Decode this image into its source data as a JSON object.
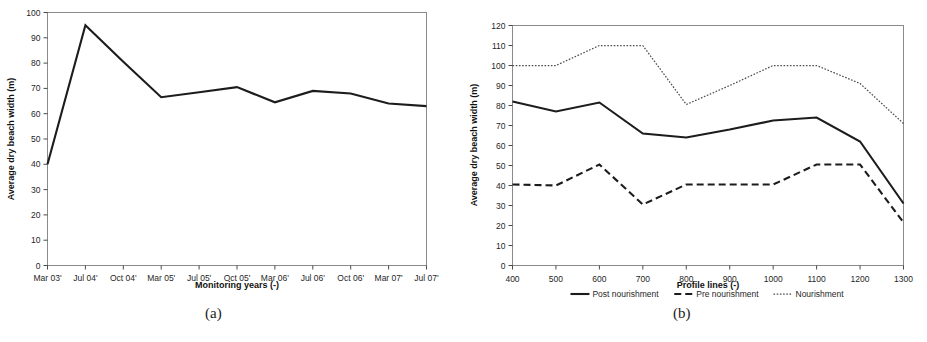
{
  "figure": {
    "caption": "",
    "subcaptions": {
      "a": "(a)",
      "b": "(b)"
    }
  },
  "chart_data": [
    {
      "id": "panel-a",
      "type": "line",
      "title": "",
      "xlabel": "Monitoring years (-)",
      "ylabel": "Average dry beach width (m)",
      "categories": [
        "Mar 03'",
        "Jul 04'",
        "Oct 04'",
        "Mar 05'",
        "Jul 05'",
        "Oct 05'",
        "Mar 06'",
        "Jul 06'",
        "Oct 06'",
        "Mar 07'",
        "Jul 07'"
      ],
      "values": [
        40,
        95,
        80.5,
        66.5,
        68.5,
        70.5,
        64.5,
        69,
        68,
        64,
        63
      ],
      "ylim": [
        0,
        100
      ],
      "yticks": [
        0,
        10,
        20,
        30,
        40,
        50,
        60,
        70,
        80,
        90,
        100
      ],
      "grid": false,
      "legend": null,
      "series_style": "solid"
    },
    {
      "id": "panel-b",
      "type": "line",
      "title": "",
      "xlabel": "Profile lines (-)",
      "ylabel": "Average dry beach width (m)",
      "x": [
        400,
        500,
        600,
        700,
        800,
        900,
        1000,
        1100,
        1200,
        1300
      ],
      "xticks": [
        400,
        500,
        600,
        700,
        800,
        900,
        1000,
        1100,
        1200,
        1300
      ],
      "ylim": [
        0,
        120
      ],
      "yticks": [
        0,
        10,
        20,
        30,
        40,
        50,
        60,
        70,
        80,
        90,
        100,
        110,
        120
      ],
      "grid": false,
      "legend_position": "bottom",
      "series": [
        {
          "name": "Post nourishment",
          "style": "solid",
          "values": [
            82,
            77,
            81.5,
            66,
            64,
            68,
            72.5,
            74,
            62,
            31
          ]
        },
        {
          "name": "Pre nourishment",
          "style": "dashed",
          "values": [
            40.5,
            40,
            50.5,
            30.5,
            40.5,
            40.5,
            40.5,
            50.5,
            50.5,
            21.5
          ]
        },
        {
          "name": "Nourishment",
          "style": "dotted",
          "values": [
            100,
            100,
            110,
            110,
            80.5,
            90,
            100,
            100,
            91,
            71
          ]
        }
      ]
    }
  ]
}
